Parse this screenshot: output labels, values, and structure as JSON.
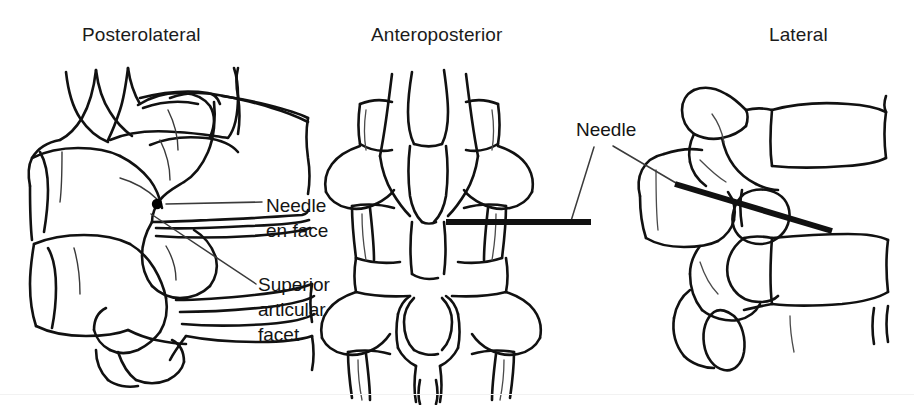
{
  "figure": {
    "kind": "medical-illustration",
    "background_color": "#ffffff",
    "ink_color": "#111111",
    "width": 914,
    "height": 405
  },
  "panels": [
    {
      "id": "posterolateral",
      "title": "Posterolateral",
      "view": "oblique posterolateral view of lumbar vertebrae"
    },
    {
      "id": "anteroposterior",
      "title": "Anteroposterior",
      "view": "frontal view of lumbar vertebrae with transverse processes"
    },
    {
      "id": "lateral",
      "title": "Lateral",
      "view": "side view of lumbar vertebrae"
    }
  ],
  "annotations": [
    {
      "id": "needle-en-face",
      "lines": [
        "Needle",
        "en face"
      ],
      "text": "Needle en face",
      "points_to": "black dot on the posterolateral view"
    },
    {
      "id": "superior-articular-facet",
      "lines": [
        "Superior",
        "articular",
        "facet"
      ],
      "text": "Superior articular facet",
      "points_to": "superior articular process on the posterolateral view"
    },
    {
      "id": "needle",
      "lines": [
        "Needle"
      ],
      "text": "Needle",
      "points_to": "needle shafts in the anteroposterior and lateral views"
    }
  ],
  "markers": {
    "needle_en_face_dot": {
      "x": 157,
      "y": 204,
      "r": 5,
      "color": "#000000"
    },
    "needle_ap": {
      "x1": 446,
      "y1": 222,
      "x2": 591,
      "y2": 222,
      "width": 6,
      "color": "#111111"
    },
    "needle_lateral": {
      "x1": 675,
      "y1": 184,
      "x2": 832,
      "y2": 231,
      "width": 6,
      "color": "#111111"
    }
  },
  "rule": {
    "color": "#f2f2f2",
    "y": 394
  }
}
